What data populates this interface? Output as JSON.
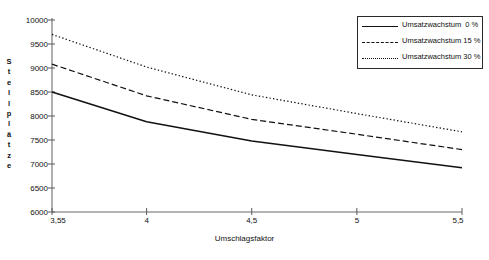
{
  "chart_data": {
    "type": "line",
    "title": "",
    "xlabel": "Umschlagsfaktor",
    "ylabel": "Stellplätze",
    "xlim": [
      3.55,
      5.5
    ],
    "ylim": [
      6000,
      10000
    ],
    "grid": false,
    "legend_position": "top-right",
    "x_ticks": [
      "3,55",
      "4",
      "4,5",
      "5",
      "5,5"
    ],
    "x_tick_values": [
      3.55,
      4,
      4.5,
      5,
      5.5
    ],
    "y_ticks": [
      "6000",
      "6500",
      "7000",
      "7500",
      "8000",
      "8500",
      "9000",
      "9500",
      "10000"
    ],
    "y_tick_values": [
      6000,
      6500,
      7000,
      7500,
      8000,
      8500,
      9000,
      9500,
      10000
    ],
    "x": [
      3.55,
      4,
      4.5,
      5,
      5.5
    ],
    "series": [
      {
        "name": "Umsatzwachstum  0 %",
        "style": "solid",
        "color": "#111111",
        "values": [
          8500,
          7880,
          7480,
          7200,
          6920
        ]
      },
      {
        "name": "Umsatzwachstum 15 %",
        "style": "dashed",
        "color": "#111111",
        "values": [
          9080,
          8420,
          7930,
          7620,
          7300
        ]
      },
      {
        "name": "Umsatzwachstum 30 %",
        "style": "dotted",
        "color": "#111111",
        "values": [
          9700,
          9020,
          8440,
          8050,
          7670
        ]
      }
    ]
  },
  "axis": {
    "vertical_label_letters": [
      "S",
      "t",
      "e",
      "l",
      "l",
      "p",
      "l",
      "ä",
      "t",
      "z",
      "e"
    ]
  },
  "legend": {
    "entries": [
      {
        "label": "Umsatzwachstum  0 %",
        "style": "solid"
      },
      {
        "label": "Umsatzwachstum 15 %",
        "style": "dashed"
      },
      {
        "label": "Umsatzwachstum 30 %",
        "style": "dotted"
      }
    ]
  },
  "footer": {
    "caption": ""
  }
}
